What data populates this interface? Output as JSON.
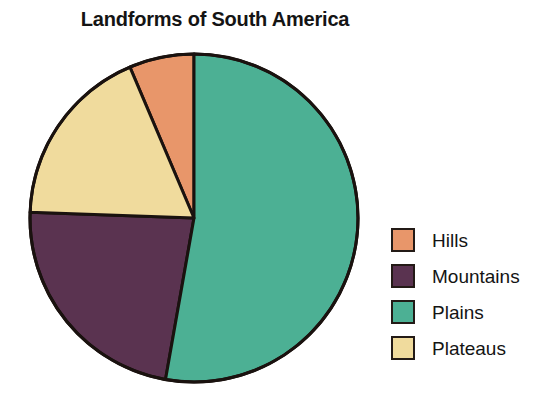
{
  "chart_data": {
    "type": "pie",
    "title": "Landforms of South America",
    "xlabel": "",
    "ylabel": "",
    "legend_position": "right",
    "grid": false,
    "categories": [
      "Hills",
      "Mountains",
      "Plains",
      "Plateaus"
    ],
    "values": [
      6,
      23,
      53,
      18
    ],
    "units": "percent",
    "slices": [
      {
        "label": "Hills",
        "value": 6,
        "color": "#E8966A",
        "start_angle_deg": 337,
        "end_angle_deg": 360
      },
      {
        "label": "Mountains",
        "value": 23,
        "color": "#5A3350",
        "start_angle_deg": 190,
        "end_angle_deg": 272
      },
      {
        "label": "Plains",
        "value": 53,
        "color": "#4CB094",
        "start_angle_deg": 0,
        "end_angle_deg": 190
      },
      {
        "label": "Plateaus",
        "value": 18,
        "color": "#F0DB9D",
        "start_angle_deg": 272,
        "end_angle_deg": 337
      }
    ],
    "outline_color": "#1A120F"
  },
  "legend": {
    "items": [
      {
        "label": "Hills",
        "color": "#E8966A",
        "swatch_name": "hills-swatch"
      },
      {
        "label": "Mountains",
        "color": "#5A3350",
        "swatch_name": "mountains-swatch"
      },
      {
        "label": "Plains",
        "color": "#4CB094",
        "swatch_name": "plains-swatch"
      },
      {
        "label": "Plateaus",
        "color": "#F0DB9D",
        "swatch_name": "plateaus-swatch"
      }
    ]
  }
}
